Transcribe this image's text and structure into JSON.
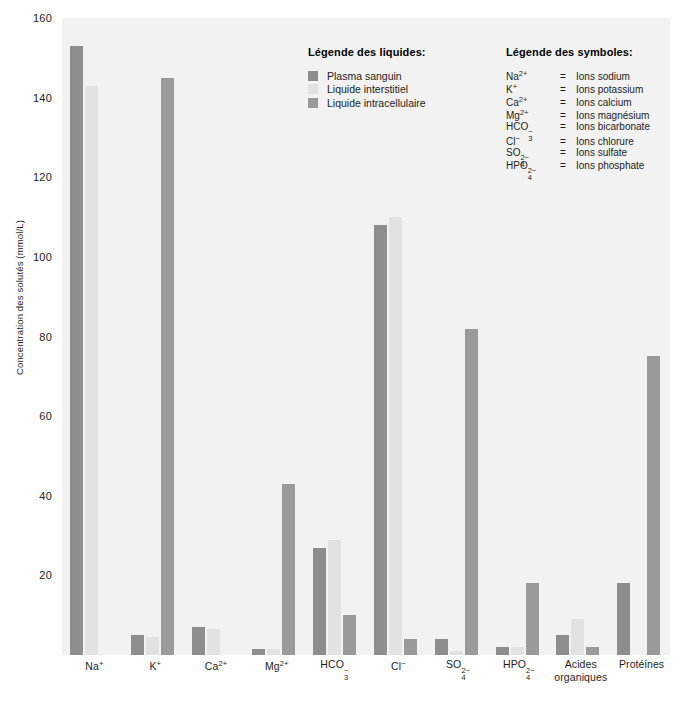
{
  "chart_data": {
    "type": "bar",
    "title": "",
    "xlabel": "",
    "ylabel": "Concentration des solutés (mmol/L)",
    "ylim": [
      0,
      160
    ],
    "yticks": [
      160,
      140,
      120,
      100,
      80,
      60,
      40,
      20
    ],
    "grid": false,
    "legend_position": "top-center",
    "categories": [
      "Na⁺",
      "K⁺",
      "Ca²⁺",
      "Mg²⁺",
      "HCO₃⁻",
      "Cl⁻",
      "SO₄²⁻",
      "HPO₄²⁻",
      "Acides organiques",
      "Protéines"
    ],
    "series": [
      {
        "name": "Plasma sanguin",
        "color": "#8e8e8e",
        "values": [
          153,
          5,
          7,
          1.5,
          27,
          108,
          4,
          2,
          5,
          18
        ]
      },
      {
        "name": "Liquide interstitiel",
        "color": "#e2e2e2",
        "values": [
          143,
          4.5,
          6.5,
          1.5,
          29,
          110,
          1,
          2,
          9,
          0
        ]
      },
      {
        "name": "Liquide intracellulaire",
        "color": "#9a9a9a",
        "values": [
          0,
          145,
          0,
          43,
          10,
          4,
          82,
          18,
          2,
          75
        ]
      }
    ]
  },
  "y_axis": {
    "label": "Concentration des solutés (mmol/L)",
    "ticks": [
      "160",
      "140",
      "120",
      "100",
      "80",
      "60",
      "40",
      "20"
    ]
  },
  "x_axis": {
    "labels": [
      {
        "base": "Na",
        "sup": "+",
        "sub": "",
        "line2": ""
      },
      {
        "base": "K",
        "sup": "+",
        "sub": "",
        "line2": ""
      },
      {
        "base": "Ca",
        "sup": "2+",
        "sub": "",
        "line2": ""
      },
      {
        "base": "Mg",
        "sup": "2+",
        "sub": "",
        "line2": ""
      },
      {
        "base": "HCO",
        "sup": "−",
        "sub": "3",
        "line2": ""
      },
      {
        "base": "Cl",
        "sup": "−",
        "sub": "",
        "line2": ""
      },
      {
        "base": "SO",
        "sup": "2−",
        "sub": "4",
        "line2": ""
      },
      {
        "base": "HPO",
        "sup": "2−",
        "sub": "4",
        "line2": ""
      },
      {
        "base": "Acides",
        "sup": "",
        "sub": "",
        "line2": "organiques"
      },
      {
        "base": "Protéines",
        "sup": "",
        "sub": "",
        "line2": ""
      }
    ]
  },
  "legend_liquides": {
    "title": "Légende des liquides:",
    "items": [
      {
        "label": "Plasma sanguin",
        "color": "#8e8e8e"
      },
      {
        "label": "Liquide interstitiel",
        "color": "#e2e2e2"
      },
      {
        "label": "Liquide intracellulaire",
        "color": "#9a9a9a"
      }
    ]
  },
  "legend_symboles": {
    "title": "Légende des symboles:",
    "equals": "=",
    "items": [
      {
        "symbol_base": "Na",
        "symbol_sup": "2+",
        "symbol_sub": "",
        "meaning": "Ions sodium"
      },
      {
        "symbol_base": "K",
        "symbol_sup": "+",
        "symbol_sub": "",
        "meaning": "Ions potassium"
      },
      {
        "symbol_base": "Ca",
        "symbol_sup": "2+",
        "symbol_sub": "",
        "meaning": "Ions calcium"
      },
      {
        "symbol_base": "Mg",
        "symbol_sup": "2+",
        "symbol_sub": "",
        "meaning": "Ions magnésium"
      },
      {
        "symbol_base": "HCO",
        "symbol_sup": "−",
        "symbol_sub": "3",
        "meaning": "Ions bicarbonate"
      },
      {
        "symbol_base": "Cl",
        "symbol_sup": "−",
        "symbol_sub": "",
        "meaning": "Ions chlorure"
      },
      {
        "symbol_base": "SO",
        "symbol_sup": "2−",
        "symbol_sub": "4",
        "meaning": "Ions sulfate"
      },
      {
        "symbol_base": "HPO",
        "symbol_sup": "2−",
        "symbol_sub": "4",
        "meaning": "Ions phosphate"
      }
    ]
  },
  "colors": {
    "plot_background": "#f2f2f2",
    "page_background": "#ffffff",
    "text": "#1d1d1d",
    "plasma": "#8e8e8e",
    "interstitiel": "#e2e2e2",
    "intracellulaire": "#9a9a9a"
  }
}
